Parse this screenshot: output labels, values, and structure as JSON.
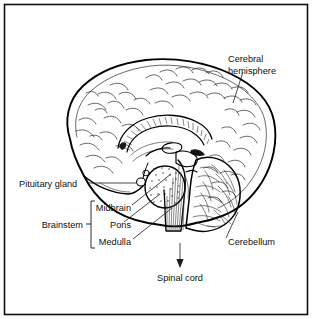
{
  "figure": {
    "background_color": "#fefefe",
    "ink_color": "#000000",
    "border_color": "#111111",
    "labels": {
      "cerebral_hemisphere_line1": "Cerebral",
      "cerebral_hemisphere_line2": "hemisphere",
      "pituitary_gland": "Pituitary gland",
      "brainstem": "Brainstem",
      "midbrain": "Midbrain",
      "pons": "Pons",
      "medulla": "Medulla",
      "cerebellum": "Cerebellum",
      "spinal_cord": "Spinal cord"
    },
    "brainstem_group": {
      "group_label": "Brainstem",
      "members": [
        "Midbrain",
        "Pons",
        "Medulla"
      ]
    },
    "callouts": [
      {
        "name": "cerebral-hemisphere",
        "text": "Cerebral hemisphere",
        "leader": "vertical-down-left"
      },
      {
        "name": "pituitary-gland",
        "text": "Pituitary gland",
        "leader": "horizontal-right"
      },
      {
        "name": "midbrain",
        "text": "Midbrain",
        "leader": "diagonal-up-right"
      },
      {
        "name": "pons",
        "text": "Pons",
        "leader": "diagonal-up-right"
      },
      {
        "name": "medulla",
        "text": "Medulla",
        "leader": "diagonal-up-right"
      },
      {
        "name": "cerebellum",
        "text": "Cerebellum",
        "leader": "diagonal-up-left"
      },
      {
        "name": "spinal-cord",
        "text": "Spinal cord",
        "leader": "arrow-down"
      }
    ],
    "structures": [
      "cerebral cortex with gyri and sulci",
      "corpus callosum (hatched band)",
      "thalamus",
      "midbrain",
      "pons (stippled oval)",
      "medulla oblongata (vertically hatched)",
      "cerebellum (arbor vitae)",
      "pituitary gland",
      "spinal cord"
    ]
  }
}
